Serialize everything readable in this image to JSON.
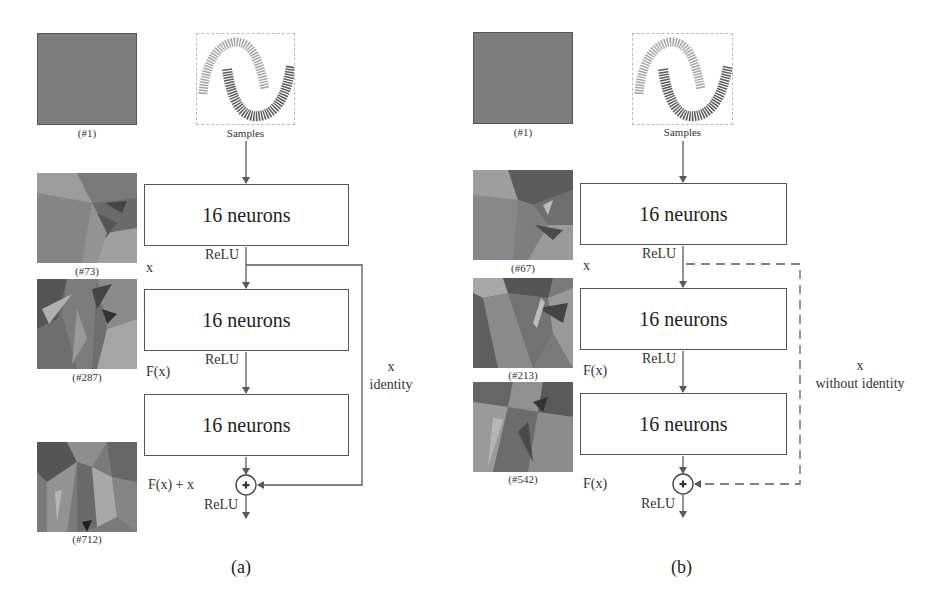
{
  "panels": [
    {
      "id": "a",
      "label": "(a)",
      "input_caption": "Samples",
      "initial_caption": "(#1)",
      "thumbnails": [
        {
          "caption": "(#73)"
        },
        {
          "caption": "(#287)"
        },
        {
          "caption": "(#712)"
        }
      ],
      "layers": [
        {
          "label": "16 neurons"
        },
        {
          "label": "16 neurons"
        },
        {
          "label": "16 neurons"
        }
      ],
      "activations": [
        "ReLU",
        "ReLU",
        "ReLU"
      ],
      "signals": {
        "x": "x",
        "fx": "F(x)",
        "out": "F(x) + x"
      },
      "skip": {
        "line1": "x",
        "line2": "identity",
        "style": "solid"
      }
    },
    {
      "id": "b",
      "label": "(b)",
      "input_caption": "Samples",
      "initial_caption": "(#1)",
      "thumbnails": [
        {
          "caption": "(#67)"
        },
        {
          "caption": "(#213)"
        },
        {
          "caption": "(#542)"
        }
      ],
      "layers": [
        {
          "label": "16 neurons"
        },
        {
          "label": "16 neurons"
        },
        {
          "label": "16 neurons"
        }
      ],
      "activations": [
        "ReLU",
        "ReLU",
        "ReLU"
      ],
      "signals": {
        "x": "x",
        "fx": "F(x)",
        "out": "F(x)"
      },
      "skip": {
        "line1": "x",
        "line2": "without identity",
        "style": "dashed"
      }
    }
  ],
  "colors": {
    "line": "#5a5a5a",
    "box_border": "#555555",
    "initial_fill": "#7d7d7d",
    "samples_light": "#9a9a9a",
    "samples_dark": "#555555"
  }
}
